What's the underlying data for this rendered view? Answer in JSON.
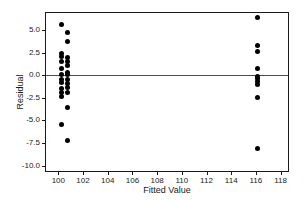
{
  "chart_data": {
    "type": "scatter",
    "title": "",
    "xlabel": "Fitted Value",
    "ylabel": "Residual",
    "xlim": [
      99.0,
      118.6
    ],
    "ylim": [
      -10.6,
      6.9
    ],
    "xticks": [
      100,
      102,
      104,
      106,
      108,
      110,
      112,
      114,
      116,
      118
    ],
    "xtick_labels": [
      "100",
      "102",
      "104",
      "106",
      "108",
      "110",
      "112",
      "114",
      "116",
      "118"
    ],
    "yticks": [
      5.0,
      2.5,
      0.0,
      -2.5,
      -5.0,
      -7.5,
      -10.0
    ],
    "ytick_labels": [
      "5.0",
      "2.5",
      "0.0",
      "-2.5",
      "-5.0",
      "-7.5",
      "-10.0"
    ],
    "grid": false,
    "legend": null,
    "reference_lines": [
      {
        "name": "zero-residual-line",
        "orientation": "horizontal",
        "y": 0.0,
        "color": "#4d4d4d"
      }
    ],
    "marker": {
      "shape": "circle",
      "color": "#000000",
      "size": 5
    },
    "points": [
      {
        "x": 100.25,
        "y": 5.6
      },
      {
        "x": 100.75,
        "y": 4.7
      },
      {
        "x": 100.75,
        "y": 3.7
      },
      {
        "x": 100.25,
        "y": 2.4
      },
      {
        "x": 100.25,
        "y": 2.1
      },
      {
        "x": 100.75,
        "y": 2.0
      },
      {
        "x": 100.25,
        "y": 1.5
      },
      {
        "x": 100.75,
        "y": 1.5
      },
      {
        "x": 100.25,
        "y": 0.7
      },
      {
        "x": 100.75,
        "y": 1.1
      },
      {
        "x": 100.75,
        "y": 0.3
      },
      {
        "x": 100.25,
        "y": 0.1
      },
      {
        "x": 100.75,
        "y": 0.1
      },
      {
        "x": 100.25,
        "y": -0.5
      },
      {
        "x": 100.75,
        "y": -0.5
      },
      {
        "x": 100.25,
        "y": -0.8
      },
      {
        "x": 100.75,
        "y": -0.9
      },
      {
        "x": 100.25,
        "y": -1.5
      },
      {
        "x": 100.75,
        "y": -1.4
      },
      {
        "x": 100.25,
        "y": -1.9
      },
      {
        "x": 100.75,
        "y": -1.9
      },
      {
        "x": 100.25,
        "y": -2.4
      },
      {
        "x": 100.75,
        "y": -3.6
      },
      {
        "x": 100.25,
        "y": -5.5
      },
      {
        "x": 100.75,
        "y": -7.2
      },
      {
        "x": 116.1,
        "y": 6.4
      },
      {
        "x": 116.1,
        "y": 3.3
      },
      {
        "x": 116.1,
        "y": 2.6
      },
      {
        "x": 116.1,
        "y": 0.7
      },
      {
        "x": 116.1,
        "y": -0.1
      },
      {
        "x": 116.1,
        "y": -0.4
      },
      {
        "x": 116.1,
        "y": -0.7
      },
      {
        "x": 116.1,
        "y": -1.0
      },
      {
        "x": 116.1,
        "y": -2.5
      },
      {
        "x": 116.1,
        "y": -8.1
      }
    ]
  }
}
